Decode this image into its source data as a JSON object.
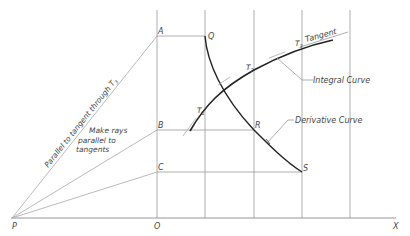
{
  "diagram": {
    "colors": {
      "background": "#ffffff",
      "grid": "#9a9a9a",
      "ray": "#a8a8a8",
      "curve": "#222222",
      "text": "#444444"
    },
    "points": {
      "P": "P",
      "O": "O",
      "X": "X",
      "A": "A",
      "B": "B",
      "C": "C",
      "Q": "Q",
      "R": "R",
      "S": "S",
      "T1": "T",
      "T1_sub": "1",
      "T2": "T",
      "T2_sub": "2",
      "T3": "T",
      "T3_sub": "3"
    },
    "labels": {
      "tangent": "Tangent",
      "integral_curve": "Integral Curve",
      "derivative_curve": "Derivative Curve",
      "parallel_note": "Parallel to tangent through T",
      "parallel_note_sub": "3",
      "rays_note_line1": "Make rays",
      "rays_note_line2": "parallel to",
      "rays_note_line3": "tangents"
    }
  }
}
